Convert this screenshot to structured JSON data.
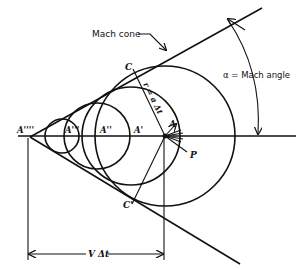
{
  "diagram": {
    "labels": {
      "mach_cone": "Mach cone",
      "alpha": "α = Mach angle",
      "radius": "r = a Δt",
      "velocity_distance": "V Δt",
      "point_C": "C",
      "point_C_prime": "C'",
      "point_A": "A",
      "point_A1": "A'",
      "point_A2": "A''",
      "point_A3": "A'''",
      "point_A4": "A''''",
      "point_P": "P"
    },
    "geometry": {
      "vertex": [
        30,
        137
      ],
      "point_A": [
        165,
        136
      ],
      "axis_y": 136,
      "circles": [
        {
          "center_x": 165,
          "radius": 70
        },
        {
          "center_x": 131,
          "radius": 49
        },
        {
          "center_x": 97,
          "radius": 33
        },
        {
          "center_x": 62,
          "radius": 17
        }
      ],
      "dimension_lines_x": [
        28,
        164
      ],
      "dimension_arrow_y": 254
    },
    "colors": {
      "ink": "#111111",
      "background": "#ffffff"
    }
  }
}
